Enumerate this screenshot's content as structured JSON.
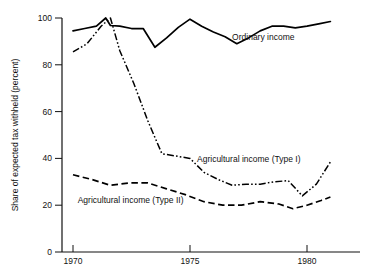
{
  "chart_data": {
    "type": "line",
    "title": "",
    "xlabel": "",
    "ylabel": "Share of expected tax withheld  (percent)",
    "xlim": [
      1969.5,
      1981.5
    ],
    "ylim": [
      0,
      100
    ],
    "grid": false,
    "legend_position": "inline-annotations",
    "x_ticks": [
      "1970",
      "1975",
      "1980"
    ],
    "x_tick_values": [
      1970,
      1975,
      1980
    ],
    "y_ticks": [
      "0",
      "20",
      "40",
      "60",
      "80",
      "100"
    ],
    "y_tick_values": [
      0,
      20,
      40,
      60,
      80,
      100
    ],
    "series": [
      {
        "name": "Ordinary income",
        "style": "solid",
        "x": [
          1970.0,
          1970.5,
          1971.0,
          1971.4,
          1971.6,
          1972.0,
          1972.5,
          1973.0,
          1973.5,
          1974.0,
          1974.5,
          1975.0,
          1975.5,
          1976.0,
          1976.5,
          1977.0,
          1977.5,
          1978.0,
          1978.5,
          1979.0,
          1979.5,
          1980.0,
          1980.5,
          1981.0
        ],
        "values": [
          94.5,
          95.5,
          96.5,
          100.0,
          96.8,
          96.5,
          95.5,
          95.5,
          87.5,
          91.5,
          96.0,
          99.5,
          96.5,
          94.0,
          92.0,
          89.0,
          91.5,
          94.5,
          96.5,
          96.5,
          95.8,
          96.5,
          97.5,
          98.5
        ]
      },
      {
        "name": "Agricultural income (Type I)",
        "style": "dash-dot-dot",
        "x": [
          1970.0,
          1970.6,
          1971.2,
          1971.6,
          1972.0,
          1972.6,
          1973.2,
          1973.8,
          1974.4,
          1975.0,
          1975.6,
          1976.2,
          1976.8,
          1977.4,
          1978.0,
          1978.6,
          1979.2,
          1979.8,
          1980.4,
          1981.0
        ],
        "values": [
          85.5,
          89.0,
          96.5,
          100.0,
          86.0,
          72.0,
          56.0,
          42.0,
          41.0,
          40.0,
          34.0,
          31.0,
          28.5,
          29.0,
          29.0,
          30.0,
          30.5,
          24.0,
          29.0,
          38.5
        ]
      },
      {
        "name": "Agricultural income (Type II)",
        "style": "dashed",
        "x": [
          1970.0,
          1970.8,
          1971.6,
          1972.4,
          1973.2,
          1974.0,
          1974.8,
          1975.6,
          1976.4,
          1977.2,
          1978.0,
          1978.8,
          1979.4,
          1980.0,
          1980.6,
          1981.0
        ],
        "values": [
          33.0,
          31.0,
          28.5,
          29.5,
          29.5,
          27.0,
          24.5,
          21.5,
          20.0,
          20.0,
          21.5,
          20.5,
          18.5,
          20.0,
          22.0,
          23.5
        ]
      }
    ],
    "annotations": [
      {
        "text": "Ordinary income",
        "x": 1976.8,
        "y": 90.5
      },
      {
        "text": "Agricultural income (Type I)",
        "x": 1975.3,
        "y": 38.5
      },
      {
        "text": "Agricultural income (Type II)",
        "x": 1970.2,
        "y": 21.0
      }
    ],
    "colors": {
      "line": "#000000",
      "text": "#111111",
      "background": "#ffffff"
    }
  }
}
